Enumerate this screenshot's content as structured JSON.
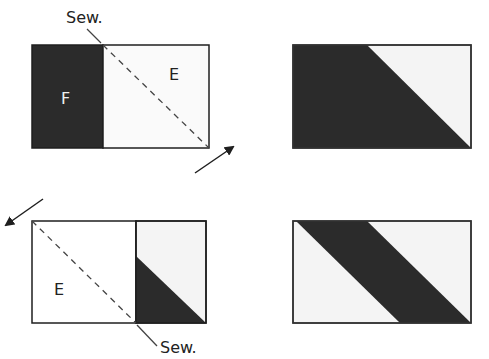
{
  "colors": {
    "dark": "#2b2b2b",
    "light": "#f4f4f4",
    "white": "#ffffff",
    "stroke": "#1f1f1f"
  },
  "diagram": {
    "step1": {
      "sew_label": "Sew.",
      "label_f": "F",
      "label_e": "E"
    },
    "step2": {
      "sew_label": "Sew.",
      "label_e": "E"
    }
  }
}
